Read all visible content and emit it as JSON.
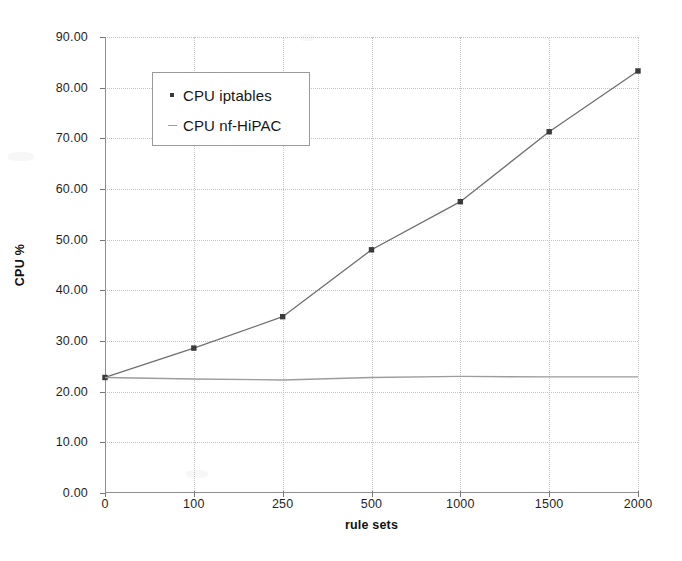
{
  "chart_data": {
    "type": "line",
    "title": "",
    "xlabel": "rule sets",
    "ylabel": "CPU %",
    "categories": [
      "0",
      "100",
      "250",
      "500",
      "1000",
      "1500",
      "2000"
    ],
    "ylim": [
      0,
      90
    ],
    "ytick_step": 10,
    "ytick_labels": [
      "0.00",
      "10.00",
      "20.00",
      "30.00",
      "40.00",
      "50.00",
      "60.00",
      "70.00",
      "80.00",
      "90.00"
    ],
    "ytick_values": [
      0,
      10,
      20,
      30,
      40,
      50,
      60,
      70,
      80,
      90
    ],
    "grid": true,
    "legend_position": "upper-left-inside",
    "series": [
      {
        "name": "CPU iptables",
        "marker": "square",
        "color": "#6f6f6f",
        "marker_color": "#3a3a3a",
        "values": [
          22.8,
          28.6,
          34.8,
          48.0,
          57.5,
          71.3,
          83.3
        ]
      },
      {
        "name": "CPU nf-HiPAC",
        "marker": "none",
        "color": "#9c9c9c",
        "marker_color": "#9c9c9c",
        "values": [
          22.8,
          22.5,
          22.3,
          22.8,
          23.0,
          22.9,
          22.9
        ]
      }
    ]
  },
  "legend": {
    "items": [
      {
        "label": "CPU iptables",
        "key": "square-marker-icon"
      },
      {
        "label": "CPU nf-HiPAC",
        "key": "dash-line-icon"
      }
    ]
  },
  "axes": {
    "x_title": "rule sets",
    "y_title": "CPU %"
  }
}
